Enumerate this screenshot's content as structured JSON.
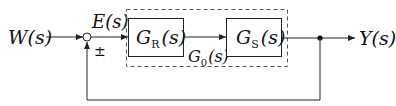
{
  "diagram": {
    "type": "control-loop-block-diagram",
    "input_label": "W(s)",
    "error_label": "E(s)",
    "sign_label": "±",
    "controller": {
      "name": "G",
      "sub": "R",
      "arg": "(s)"
    },
    "plant": {
      "name": "G",
      "sub": "S",
      "arg": "(s)"
    },
    "open_loop": {
      "name": "G",
      "sub": "0",
      "arg": "(s)"
    },
    "output_label": "Y(s)",
    "colors": {
      "line": "#222222",
      "background": "#ffffff"
    }
  }
}
